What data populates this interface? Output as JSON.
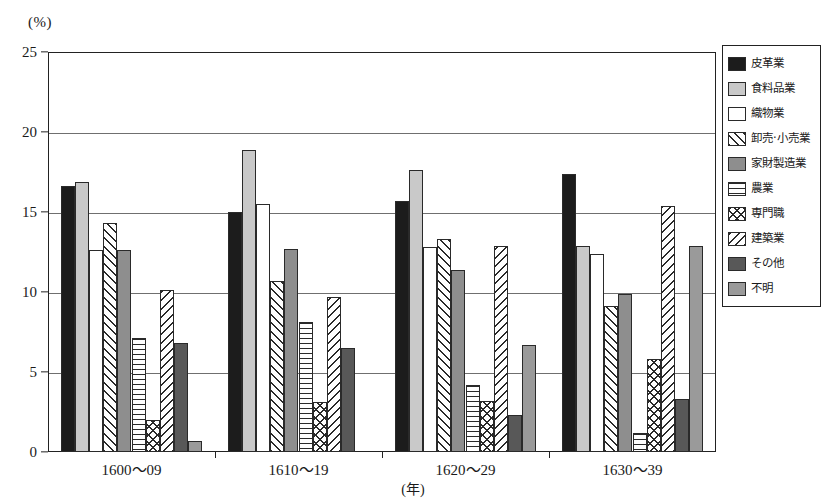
{
  "chart_data": {
    "type": "bar",
    "title": "",
    "xlabel": "(年)",
    "ylabel": "(%)",
    "ylim": [
      0,
      25
    ],
    "yticks": [
      0,
      5,
      10,
      15,
      20,
      25
    ],
    "grid": true,
    "legend_position": "right",
    "categories": [
      "1600〜09",
      "1610〜19",
      "1620〜29",
      "1630〜39"
    ],
    "series": [
      {
        "name": "皮革業",
        "pattern": "solid-black",
        "values": [
          16.6,
          15.0,
          15.7,
          17.4
        ]
      },
      {
        "name": "食料品業",
        "pattern": "light-gray",
        "values": [
          16.9,
          18.9,
          17.6,
          12.9
        ]
      },
      {
        "name": "織物業",
        "pattern": "white",
        "values": [
          12.6,
          15.5,
          12.8,
          12.4
        ]
      },
      {
        "name": "卸売·小売業",
        "pattern": "diag-back",
        "values": [
          14.3,
          10.7,
          13.3,
          9.1
        ]
      },
      {
        "name": "家財製造業",
        "pattern": "mid-gray",
        "values": [
          12.6,
          12.7,
          11.4,
          9.9
        ]
      },
      {
        "name": "農業",
        "pattern": "h-lines",
        "values": [
          7.1,
          8.1,
          4.2,
          1.2
        ]
      },
      {
        "name": "専門職",
        "pattern": "cross-hatch",
        "values": [
          2.0,
          3.1,
          3.2,
          5.8
        ]
      },
      {
        "name": "建築業",
        "pattern": "diag-fwd",
        "values": [
          10.1,
          9.7,
          12.9,
          15.4
        ]
      },
      {
        "name": "その他",
        "pattern": "dark-gray",
        "values": [
          6.8,
          6.5,
          2.3,
          3.3
        ]
      },
      {
        "name": "不明",
        "pattern": "gray",
        "values": [
          0.7,
          0.0,
          6.7,
          12.9
        ]
      }
    ]
  },
  "axis": {
    "unit_label": "(%)",
    "x_title": "(年)",
    "ytick_labels": [
      "0",
      "5",
      "10",
      "15",
      "20",
      "25"
    ]
  },
  "legend": {
    "items": [
      {
        "label": "皮革業",
        "pattern": "solid-black"
      },
      {
        "label": "食料品業",
        "pattern": "light-gray"
      },
      {
        "label": "織物業",
        "pattern": "white"
      },
      {
        "label": "卸売·小売業",
        "pattern": "diag-back"
      },
      {
        "label": "家財製造業",
        "pattern": "mid-gray"
      },
      {
        "label": "農業",
        "pattern": "h-lines"
      },
      {
        "label": "専門職",
        "pattern": "cross-hatch"
      },
      {
        "label": "建築業",
        "pattern": "diag-fwd"
      },
      {
        "label": "その他",
        "pattern": "dark-gray"
      },
      {
        "label": "不明",
        "pattern": "gray"
      }
    ]
  }
}
